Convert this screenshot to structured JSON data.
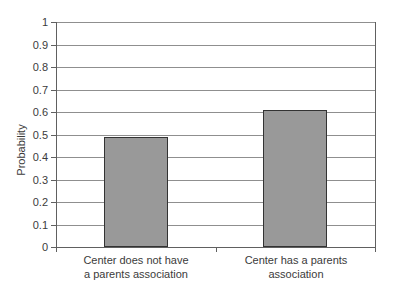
{
  "chart_data": {
    "type": "bar",
    "title": "",
    "xlabel": "",
    "ylabel": "Probability",
    "ylim": [
      0,
      1
    ],
    "ytick_step": 0.1,
    "grid": true,
    "legend": "none",
    "yticks": [
      "1",
      "0.9",
      "0.8",
      "0.7",
      "0.6",
      "0.5",
      "0.4",
      "0.3",
      "0.2",
      "0.1",
      "0"
    ],
    "categories": [
      {
        "label": "Center does not have a parents association",
        "label_lines": [
          "Center does not have",
          "a parents association"
        ],
        "value": 0.49
      },
      {
        "label": "Center has a parents association",
        "label_lines": [
          "Center has a parents",
          "association"
        ],
        "value": 0.61
      }
    ],
    "colors": {
      "bar_fill": "#999999",
      "bar_border": "#333333",
      "gridline": "#8f8f8f",
      "axis": "#606060",
      "text": "#3b3b3b",
      "background": "#ffffff"
    }
  }
}
